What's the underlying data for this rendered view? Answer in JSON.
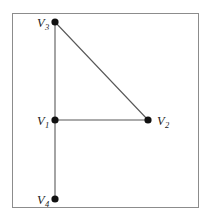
{
  "figure": {
    "name": "graph-diagram",
    "background_color": "#ffffff",
    "frame": {
      "name": "figure-border",
      "x": 12,
      "y": 13,
      "width": 186,
      "height": 194,
      "stroke_color": "#8c8c8c",
      "stroke_width": 1
    },
    "vertex_color": "#111111",
    "edge_color": "#595959",
    "label_color": "#222222",
    "vertices": [
      {
        "id": "V1",
        "base": "V",
        "subscript": "1",
        "x": 55,
        "y": 120,
        "radius": 3.6,
        "label_x": 37,
        "label_y": 125,
        "label_side": "left"
      },
      {
        "id": "V2",
        "base": "V",
        "subscript": "2",
        "x": 148,
        "y": 120,
        "radius": 3.6,
        "label_x": 157,
        "label_y": 125,
        "label_side": "right"
      },
      {
        "id": "V3",
        "base": "V",
        "subscript": "3",
        "x": 55,
        "y": 22,
        "radius": 3.6,
        "label_x": 37,
        "label_y": 27,
        "label_side": "left"
      },
      {
        "id": "V4",
        "base": "V",
        "subscript": "4",
        "x": 55,
        "y": 199,
        "radius": 3.6,
        "label_x": 37,
        "label_y": 204,
        "label_side": "left"
      }
    ],
    "edges": [
      {
        "id": "V3-V1",
        "from": "V3",
        "to": "V1",
        "x1": 55,
        "y1": 22,
        "x2": 55,
        "y2": 120
      },
      {
        "id": "V1-V4",
        "from": "V1",
        "to": "V4",
        "x1": 55,
        "y1": 120,
        "x2": 55,
        "y2": 199
      },
      {
        "id": "V1-V2",
        "from": "V1",
        "to": "V2",
        "x1": 55,
        "y1": 120,
        "x2": 148,
        "y2": 120
      },
      {
        "id": "V3-V2",
        "from": "V3",
        "to": "V2",
        "x1": 55,
        "y1": 22,
        "x2": 148,
        "y2": 120
      }
    ]
  }
}
